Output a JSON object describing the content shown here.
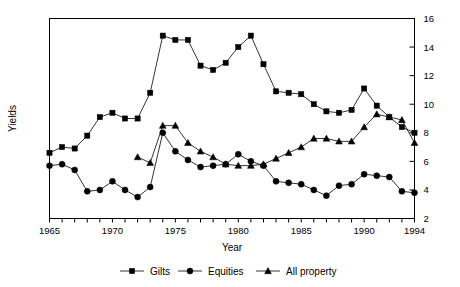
{
  "chart_data": {
    "type": "line",
    "title": "",
    "xlabel": "Year",
    "ylabel": "Yields",
    "xlim": [
      1965,
      1994
    ],
    "ylim": [
      2,
      16
    ],
    "y_ticks": [
      2,
      4,
      6,
      8,
      10,
      12,
      14,
      16
    ],
    "x_ticks": [
      1965,
      1966,
      1967,
      1968,
      1969,
      1970,
      1971,
      1972,
      1973,
      1974,
      1975,
      1976,
      1977,
      1978,
      1979,
      1980,
      1981,
      1982,
      1983,
      1984,
      1985,
      1986,
      1987,
      1988,
      1989,
      1990,
      1991,
      1992,
      1993,
      1994
    ],
    "x_tick_labels": [
      "1965",
      "1970",
      "1975",
      "1980",
      "1985",
      "1990",
      "1994"
    ],
    "x_tick_label_years": [
      1965,
      1970,
      1975,
      1980,
      1985,
      1990,
      1994
    ],
    "y_axis_position": "right",
    "grid": false,
    "legend_position": "bottom",
    "x": [
      1965,
      1966,
      1967,
      1968,
      1969,
      1970,
      1971,
      1972,
      1973,
      1974,
      1975,
      1976,
      1977,
      1978,
      1979,
      1980,
      1981,
      1982,
      1983,
      1984,
      1985,
      1986,
      1987,
      1988,
      1989,
      1990,
      1991,
      1992,
      1993,
      1994
    ],
    "series": [
      {
        "name": "Gilts",
        "marker": "square",
        "x": [
          1965,
          1966,
          1967,
          1968,
          1969,
          1970,
          1971,
          1972,
          1973,
          1974,
          1975,
          1976,
          1977,
          1978,
          1979,
          1980,
          1981,
          1982,
          1983,
          1984,
          1985,
          1986,
          1987,
          1988,
          1989,
          1990,
          1991,
          1992,
          1993,
          1994
        ],
        "values": [
          6.6,
          7.0,
          6.9,
          7.8,
          9.1,
          9.4,
          9.0,
          9.0,
          10.8,
          14.8,
          14.5,
          14.5,
          12.7,
          12.4,
          12.9,
          14.0,
          14.8,
          12.8,
          10.9,
          10.8,
          10.7,
          10.0,
          9.5,
          9.4,
          9.6,
          11.1,
          9.9,
          9.1,
          8.4,
          8.0
        ]
      },
      {
        "name": "Equities",
        "marker": "circle",
        "x": [
          1965,
          1966,
          1967,
          1968,
          1969,
          1970,
          1971,
          1972,
          1973,
          1974,
          1975,
          1976,
          1977,
          1978,
          1979,
          1980,
          1981,
          1982,
          1983,
          1984,
          1985,
          1986,
          1987,
          1988,
          1989,
          1990,
          1991,
          1992,
          1993,
          1994
        ],
        "values": [
          5.7,
          5.8,
          5.4,
          3.9,
          4.0,
          4.6,
          4.0,
          3.5,
          4.2,
          8.0,
          6.7,
          6.1,
          5.6,
          5.7,
          5.8,
          6.5,
          6.0,
          5.7,
          4.6,
          4.5,
          4.4,
          4.0,
          3.6,
          4.3,
          4.4,
          5.1,
          5.0,
          4.9,
          3.9,
          3.8
        ]
      },
      {
        "name": "All property",
        "marker": "triangle",
        "x": [
          1972,
          1973,
          1974,
          1975,
          1976,
          1977,
          1978,
          1979,
          1980,
          1981,
          1982,
          1983,
          1984,
          1985,
          1986,
          1987,
          1988,
          1989,
          1990,
          1991,
          1992,
          1993,
          1994
        ],
        "values": [
          6.3,
          5.9,
          8.5,
          8.5,
          7.3,
          6.7,
          6.3,
          5.8,
          5.7,
          5.7,
          5.8,
          6.2,
          6.6,
          7.0,
          7.6,
          7.6,
          7.4,
          7.4,
          8.4,
          9.3,
          9.1,
          8.9,
          7.3
        ]
      }
    ]
  },
  "axes": {
    "ylabel": "Yields",
    "xlabel": "Year"
  },
  "legend": {
    "items": [
      {
        "label": "Gilts",
        "marker": "square"
      },
      {
        "label": "Equities",
        "marker": "circle"
      },
      {
        "label": "All property",
        "marker": "triangle"
      }
    ]
  }
}
